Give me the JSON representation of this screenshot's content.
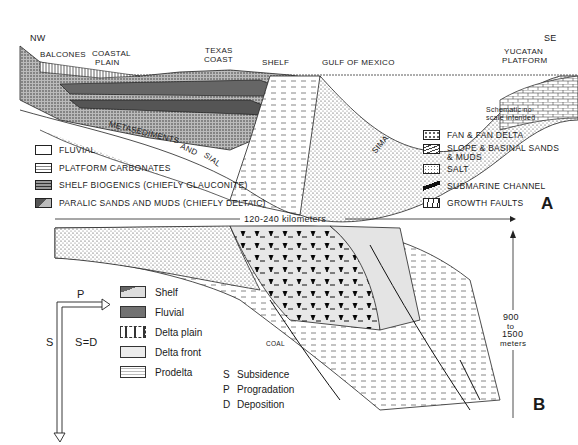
{
  "panel_a": {
    "panel_label": "A",
    "orientation": {
      "left": "NW",
      "right": "SE"
    },
    "place_labels": {
      "balcones": "BALCONES",
      "coastal_plain_1": "COASTAL",
      "coastal_plain_2": "PLAIN",
      "texas_coast_1": "TEXAS",
      "texas_coast_2": "COAST",
      "shelf": "SHELF",
      "gulf": "GULF OF MEXICO",
      "yucatan_1": "YUCATAN",
      "yucatan_2": "PLATFORM"
    },
    "basement_labels": {
      "metasediments": "METASEDIMENTS",
      "and": "AND",
      "sial": "SIAL",
      "sima": "SIMA"
    },
    "note_1": "Schematic no",
    "note_2": "scale intended",
    "legend_left": [
      {
        "label": "FLUVIAL",
        "pattern": "blank"
      },
      {
        "label": "PLATFORM CARBONATES",
        "pattern": "brick"
      },
      {
        "label": "SHELF BIOGENICS (CHIEFLY GLAUCONITE)",
        "pattern": "dashed-stipple"
      },
      {
        "label": "PARALIC SANDS AND MUDS (CHIEFLY DELTAIC)",
        "pattern": "dark-stipple"
      }
    ],
    "legend_right": [
      {
        "label": "FAN & FAN DELTA",
        "pattern": "pebbly"
      },
      {
        "label": "SLOPE & BASINAL SANDS",
        "label2": "& MUDS",
        "pattern": "curved-lines"
      },
      {
        "label": "SALT",
        "pattern": "dots"
      },
      {
        "label": "SUBMARINE CHANNEL",
        "pattern": "diagonal-bar"
      },
      {
        "label": "GROWTH FAULTS",
        "pattern": "curved-faults"
      }
    ]
  },
  "panel_b": {
    "panel_label": "B",
    "width_scale": "120-240 kilometers",
    "thickness_scale": [
      "900",
      "to",
      "1500",
      "meters"
    ],
    "coal_label": "COAL",
    "axis": {
      "p": "P",
      "s": "S",
      "sd": "S=D"
    },
    "legend": [
      {
        "label": "Shelf",
        "pattern": "shelf"
      },
      {
        "label": "Fluvial",
        "pattern": "fine-stipple"
      },
      {
        "label": "Delta plain",
        "pattern": "dashes"
      },
      {
        "label": "Delta front",
        "pattern": "light-grey"
      },
      {
        "label": "Prodelta",
        "pattern": "dash-lines"
      }
    ],
    "key": [
      {
        "letter": "S",
        "meaning": "Subsidence"
      },
      {
        "letter": "P",
        "meaning": "Progradation"
      },
      {
        "letter": "D",
        "meaning": "Deposition"
      }
    ]
  }
}
